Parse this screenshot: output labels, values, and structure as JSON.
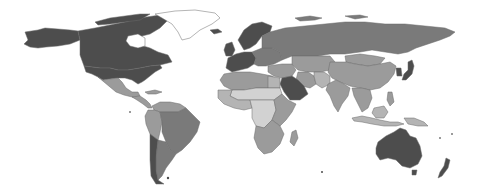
{
  "map": {
    "type": "choropleth",
    "projection": "equirectangular",
    "background": "#ffffff",
    "border_color": "#6a6a6a",
    "classes": [
      {
        "id": "c1",
        "label": "",
        "color": "#4d4d4d"
      },
      {
        "id": "c2",
        "label": "",
        "color": "#7a7a7a"
      },
      {
        "id": "c3",
        "label": "",
        "color": "#9b9b9b"
      },
      {
        "id": "c4",
        "label": "",
        "color": "#b4b4b4"
      },
      {
        "id": "c5",
        "label": "",
        "color": "#d2d2d2"
      },
      {
        "id": "nodata",
        "label": "",
        "color": "#ffffff"
      }
    ],
    "regions": [
      {
        "name": "Canada",
        "class": "c1"
      },
      {
        "name": "United States",
        "class": "c1"
      },
      {
        "name": "Alaska",
        "class": "c1"
      },
      {
        "name": "Greenland",
        "class": "nodata"
      },
      {
        "name": "Mexico",
        "class": "c3"
      },
      {
        "name": "Central America",
        "class": "c3"
      },
      {
        "name": "Brazil",
        "class": "c2"
      },
      {
        "name": "Argentina",
        "class": "c2"
      },
      {
        "name": "Chile",
        "class": "c1"
      },
      {
        "name": "Andean South America",
        "class": "c3"
      },
      {
        "name": "Venezuela / Guianas",
        "class": "c3"
      },
      {
        "name": "Western Europe",
        "class": "c1"
      },
      {
        "name": "Scandinavia",
        "class": "c1"
      },
      {
        "name": "Eastern Europe",
        "class": "c2"
      },
      {
        "name": "Russia",
        "class": "c2"
      },
      {
        "name": "Kazakhstan / Central Asia",
        "class": "c3"
      },
      {
        "name": "China",
        "class": "c3"
      },
      {
        "name": "Mongolia",
        "class": "c3"
      },
      {
        "name": "Japan",
        "class": "c1"
      },
      {
        "name": "Korea",
        "class": "c1"
      },
      {
        "name": "India",
        "class": "c3"
      },
      {
        "name": "Southeast Asia",
        "class": "c3"
      },
      {
        "name": "Indonesia",
        "class": "c4"
      },
      {
        "name": "Saudi Arabia",
        "class": "c1"
      },
      {
        "name": "Middle East",
        "class": "c3"
      },
      {
        "name": "Iran",
        "class": "c3"
      },
      {
        "name": "Afghanistan / Pakistan",
        "class": "c4"
      },
      {
        "name": "North Africa",
        "class": "c3"
      },
      {
        "name": "Sahel",
        "class": "c5"
      },
      {
        "name": "West Africa",
        "class": "c4"
      },
      {
        "name": "Central Africa",
        "class": "c5"
      },
      {
        "name": "East Africa",
        "class": "c3"
      },
      {
        "name": "Southern Africa",
        "class": "c3"
      },
      {
        "name": "Madagascar",
        "class": "c3"
      },
      {
        "name": "Australia",
        "class": "c1"
      },
      {
        "name": "New Zealand",
        "class": "c1"
      },
      {
        "name": "Papua New Guinea",
        "class": "c4"
      }
    ]
  }
}
